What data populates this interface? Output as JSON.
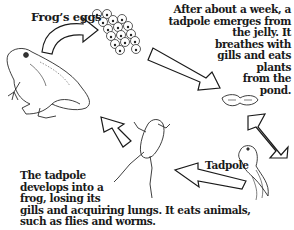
{
  "diagram": {
    "stages": [
      {
        "id": "frog",
        "label": ""
      },
      {
        "id": "eggs",
        "label": "Frog’s eggs"
      },
      {
        "id": "tadpole",
        "label": "Tadpole"
      },
      {
        "id": "froglet",
        "label": ""
      }
    ],
    "captions": {
      "eggs_to_tadpole": [
        "After about a week, a",
        "tadpole emerges from",
        "the jelly. It",
        "breathes with",
        "gills and eats",
        "plants",
        "from the",
        "pond."
      ],
      "tadpole_to_frog": [
        "The tadpole",
        "develops into a",
        "frog, losing its",
        "gills and acquiring lungs. It eats animals,",
        "such as flies and worms."
      ]
    },
    "arrows": [
      {
        "from": "frog",
        "to": "eggs",
        "shape": "curved"
      },
      {
        "from": "eggs",
        "to": "hatchling",
        "shape": "bent"
      },
      {
        "from": "hatchling",
        "to": "tadpole",
        "shape": "bent"
      },
      {
        "from": "tadpole",
        "to": "froglet",
        "shape": "bent"
      },
      {
        "from": "froglet",
        "to": "frog",
        "shape": "bent"
      }
    ]
  }
}
